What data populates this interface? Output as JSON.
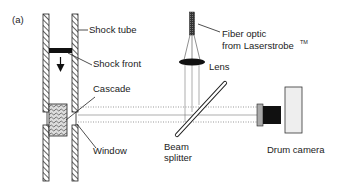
{
  "panel_label": "(a)",
  "labels": {
    "shock_tube": "Shock tube",
    "shock_front": "Shock front",
    "cascade": "Cascade",
    "window": "Window",
    "fiber_optic_line1": "Fiber optic",
    "fiber_optic_line2": "from Laserstrobe",
    "fiber_optic_tm": "TM",
    "lens": "Lens",
    "beam_splitter_line1": "Beam",
    "beam_splitter_line2": "splitter",
    "drum_camera": "Drum camera"
  },
  "colors": {
    "ink": "#222222",
    "camera_body": "#eeeeee",
    "background": "#ffffff"
  }
}
